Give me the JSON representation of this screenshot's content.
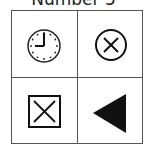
{
  "title": "Number 5",
  "cells": [
    {
      "position": "top-left",
      "icon": "clock-icon",
      "time": "9:00"
    },
    {
      "position": "top-right",
      "icon": "circle-x-icon"
    },
    {
      "position": "bottom-left",
      "icon": "square-x-icon"
    },
    {
      "position": "bottom-right",
      "icon": "left-triangle-icon"
    }
  ]
}
